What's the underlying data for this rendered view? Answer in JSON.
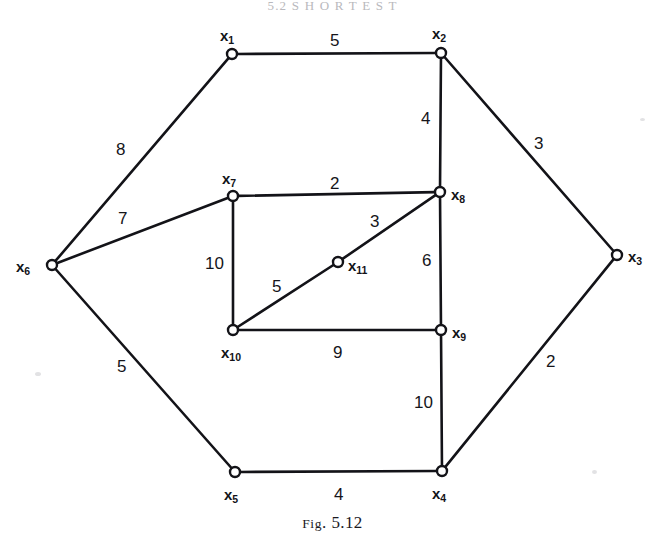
{
  "page": {
    "running_head": "5.2  S H O R T E S T",
    "caption_prefix": "Fig",
    "caption_rest": ". 5.12",
    "width": 665,
    "height": 544,
    "background": "#ffffff",
    "ink": "#131318"
  },
  "graph": {
    "type": "undirected-weighted-graph",
    "node_radius": 5,
    "nodes": [
      {
        "id": "x1",
        "label": "x",
        "sub": "1",
        "x": 232,
        "y": 54,
        "label_x": 220,
        "label_y": 28
      },
      {
        "id": "x2",
        "label": "x",
        "sub": "2",
        "x": 441,
        "y": 53,
        "label_x": 432,
        "label_y": 26
      },
      {
        "id": "x3",
        "label": "x",
        "sub": "3",
        "x": 617,
        "y": 255,
        "label_x": 628,
        "label_y": 249
      },
      {
        "id": "x4",
        "label": "x",
        "sub": "4",
        "x": 442,
        "y": 471,
        "label_x": 432,
        "label_y": 486
      },
      {
        "id": "x5",
        "label": "x",
        "sub": "5",
        "x": 235,
        "y": 472,
        "label_x": 224,
        "label_y": 487
      },
      {
        "id": "x6",
        "label": "x",
        "sub": "6",
        "x": 52,
        "y": 265,
        "label_x": 16,
        "label_y": 259
      },
      {
        "id": "x7",
        "label": "x",
        "sub": "7",
        "x": 233,
        "y": 196,
        "label_x": 222,
        "label_y": 171
      },
      {
        "id": "x8",
        "label": "x",
        "sub": "8",
        "x": 440,
        "y": 192,
        "label_x": 451,
        "label_y": 187
      },
      {
        "id": "x9",
        "label": "x",
        "sub": "9",
        "x": 441,
        "y": 330,
        "label_x": 452,
        "label_y": 325
      },
      {
        "id": "x10",
        "label": "x",
        "sub": "10",
        "x": 233,
        "y": 330,
        "label_x": 221,
        "label_y": 345
      },
      {
        "id": "x11",
        "label": "x",
        "sub": "11",
        "x": 338,
        "y": 262,
        "label_x": 348,
        "label_y": 258
      }
    ],
    "edges": [
      {
        "from": "x1",
        "to": "x2",
        "weight": "5",
        "label_x": 330,
        "label_y": 32
      },
      {
        "from": "x1",
        "to": "x6",
        "weight": "8",
        "label_x": 116,
        "label_y": 141
      },
      {
        "from": "x2",
        "to": "x3",
        "weight": "3",
        "label_x": 534,
        "label_y": 135
      },
      {
        "from": "x2",
        "to": "x8",
        "weight": "4",
        "label_x": 421,
        "label_y": 110
      },
      {
        "from": "x3",
        "to": "x4",
        "weight": "2",
        "label_x": 546,
        "label_y": 353
      },
      {
        "from": "x4",
        "to": "x5",
        "weight": "4",
        "label_x": 334,
        "label_y": 486
      },
      {
        "from": "x4",
        "to": "x9",
        "weight": "10",
        "label_x": 414,
        "label_y": 394
      },
      {
        "from": "x5",
        "to": "x6",
        "weight": "5",
        "label_x": 117,
        "label_y": 358
      },
      {
        "from": "x6",
        "to": "x7",
        "weight": "7",
        "label_x": 118,
        "label_y": 210
      },
      {
        "from": "x7",
        "to": "x8",
        "weight": "2",
        "label_x": 330,
        "label_y": 175
      },
      {
        "from": "x7",
        "to": "x10",
        "weight": "10",
        "label_x": 205,
        "label_y": 255
      },
      {
        "from": "x8",
        "to": "x9",
        "weight": "6",
        "label_x": 422,
        "label_y": 252
      },
      {
        "from": "x8",
        "to": "x11",
        "weight": "3",
        "label_x": 370,
        "label_y": 213
      },
      {
        "from": "x10",
        "to": "x11",
        "weight": "5",
        "label_x": 272,
        "label_y": 278
      },
      {
        "from": "x9",
        "to": "x10",
        "weight": "9",
        "label_x": 333,
        "label_y": 344
      }
    ]
  }
}
